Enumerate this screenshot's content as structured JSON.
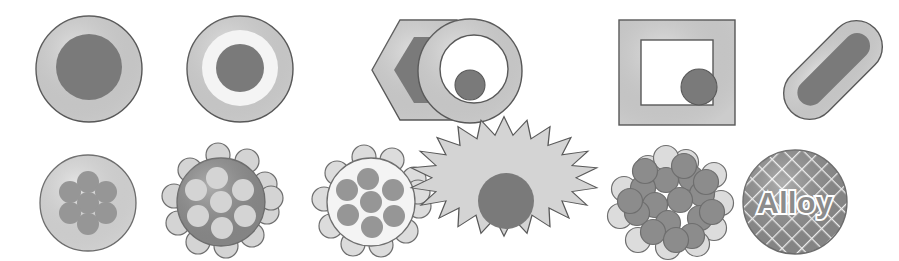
{
  "figure": {
    "background_color": "#ffffff",
    "width": 899,
    "height": 261,
    "rows": 2,
    "columns": 6
  },
  "palette": {
    "dark_gray": "#7a7a7a",
    "mid_gray": "#8c8c8c",
    "light_gray": "#d4d4d4",
    "pale_gray": "#dcdcdc",
    "near_white": "#f2f2f2",
    "white": "#ffffff",
    "outline": "#595959",
    "outline_soft": "#6e6e6e",
    "hatch_line": "#ffffff"
  },
  "labels": {
    "alloy": "Alloy"
  },
  "particles": [
    {
      "index": 1,
      "row": 1,
      "column": 1,
      "name": "core-shell-sphere",
      "description": "Light gray sphere with solid dark gray core",
      "shell_color": "#d4d4d4",
      "core_color": "#7a7a7a",
      "outline_color": "#595959"
    },
    {
      "index": 2,
      "row": 1,
      "column": 2,
      "name": "double-shell-sphere",
      "description": "Light gray outer shell, near-white middle shell, dark gray core",
      "shell_color": "#d4d4d4",
      "mid_shell_color": "#f2f2f2",
      "core_color": "#7a7a7a",
      "outline_color": "#595959"
    },
    {
      "index": 3,
      "row": 1,
      "column": 3,
      "name": "core-shell-hexagon",
      "description": "Light gray hexagon with dark gray hexagonal core",
      "shell_color": "#d4d4d4",
      "core_color": "#7a7a7a",
      "outline_color": "#595959"
    },
    {
      "index": 4,
      "row": 1,
      "column": 4,
      "name": "hollow-ring-with-eccentric-core",
      "description": "Light gray annulus, hollow white interior, off-center dark gray circle",
      "shell_color": "#d4d4d4",
      "cavity_color": "#ffffff",
      "core_color": "#7a7a7a",
      "outline_color": "#595959"
    },
    {
      "index": 5,
      "row": 1,
      "column": 5,
      "name": "hollow-square-frame-with-core",
      "description": "Light gray square frame, hollow white interior, dark gray circle at lower right",
      "shell_color": "#d4d4d4",
      "cavity_color": "#ffffff",
      "core_color": "#7a7a7a",
      "outline_color": "#595959"
    },
    {
      "index": 6,
      "row": 1,
      "column": 6,
      "name": "core-shell-nanorod",
      "description": "Diagonal rounded rod, light gray shell with dark gray rod core",
      "shell_color": "#d4d4d4",
      "core_color": "#7a7a7a",
      "outline_color": "#595959",
      "rotation_degrees": -45
    },
    {
      "index": 7,
      "row": 2,
      "column": 1,
      "name": "multicore-light-sphere",
      "description": "Pale gray sphere containing seven dark gray dots",
      "shell_color": "#dcdcdc",
      "dot_color": "#969696",
      "dot_count": 7,
      "outline_color": "#6e6e6e"
    },
    {
      "index": 8,
      "row": 2,
      "column": 2,
      "name": "dark-sphere-with-light-satellites",
      "description": "Dark gray sphere with light interior dots and light satellite bumps around the rim",
      "shell_color": "#8c8c8c",
      "dot_color": "#d4d4d4",
      "satellite_color": "#d4d4d4",
      "dot_count": 7,
      "satellite_count": 11,
      "outline_color": "#6e6e6e"
    },
    {
      "index": 9,
      "row": 2,
      "column": 3,
      "name": "bumpy-light-sphere-with-dark-cores",
      "description": "Near-white bumpy sphere with light satellite bumps and seven dark gray inner dots",
      "shell_color": "#f2f2f2",
      "dot_color": "#969696",
      "satellite_color": "#dcdcdc",
      "dot_count": 7,
      "satellite_count": 11,
      "outline_color": "#6e6e6e"
    },
    {
      "index": 10,
      "row": 2,
      "column": 4,
      "name": "spiky-star-with-core",
      "description": "Light gray spiked star (nanostar) with dark gray circular core",
      "shell_color": "#d4d4d4",
      "core_color": "#7a7a7a",
      "spike_count": 16,
      "outline_color": "#595959"
    },
    {
      "index": 11,
      "row": 2,
      "column": 5,
      "name": "aggregate-cluster",
      "description": "Dense aggregate of mixed dark gray and pale gray spheres",
      "dark_sphere_color": "#8c8c8c",
      "light_sphere_color": "#dcdcdc",
      "sphere_count": 28,
      "outline_color": "#6e6e6e"
    },
    {
      "index": 12,
      "row": 2,
      "column": 6,
      "name": "alloy-sphere",
      "description": "Cross-hatched gray sphere labeled Alloy",
      "fill_color": "#8c8c8c",
      "hatch_color": "#ffffff",
      "label": "Alloy",
      "label_color": "#8c8c8c",
      "label_stroke_color": "#ffffff",
      "outline_color": "#6e6e6e"
    }
  ]
}
